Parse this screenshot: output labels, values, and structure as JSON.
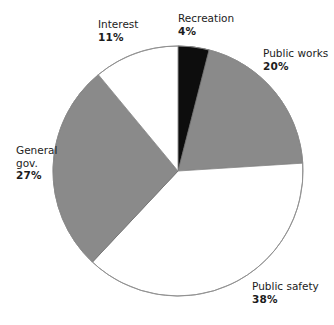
{
  "chart_data": {
    "type": "pie",
    "title": "",
    "categories": [
      "Recreation",
      "Public works",
      "Public safety",
      "General gov.",
      "Interest"
    ],
    "values": [
      4,
      20,
      38,
      27,
      11
    ],
    "unit": "%",
    "legend": "none",
    "start_angle_deg": 0,
    "direction": "clockwise",
    "slices": [
      {
        "label": "Recreation",
        "value": 4,
        "value_text": "4%",
        "color": "#0d0d0d",
        "fill_name": "black",
        "start_pct": 0,
        "end_pct": 4
      },
      {
        "label": "Public works",
        "value": 20,
        "value_text": "20%",
        "color": "#8a8a8a",
        "fill_name": "gray",
        "start_pct": 4,
        "end_pct": 24
      },
      {
        "label": "Public safety",
        "value": 38,
        "value_text": "38%",
        "color": "#ffffff",
        "fill_name": "white",
        "start_pct": 24,
        "end_pct": 62
      },
      {
        "label": "General gov.",
        "value": 27,
        "value_text": "27%",
        "color": "#8a8a8a",
        "fill_name": "gray",
        "start_pct": 62,
        "end_pct": 89
      },
      {
        "label": "Interest",
        "value": 11,
        "value_text": "11%",
        "color": "#ffffff",
        "fill_name": "white",
        "start_pct": 89,
        "end_pct": 100
      }
    ]
  },
  "labels": {
    "recreation": {
      "name": "Recreation",
      "pct": "4%"
    },
    "public_works": {
      "name": "Public works",
      "pct": "20%"
    },
    "public_safety": {
      "name": "Public safety",
      "pct": "38%"
    },
    "general_gov": {
      "name": "General",
      "name2": "gov.",
      "pct": "27%"
    },
    "interest": {
      "name": "Interest",
      "pct": "11%"
    }
  },
  "geometry": {
    "center_x": 178,
    "center_y": 171,
    "radius": 125
  },
  "colors": {
    "background": "#ffffff",
    "gray_fill": "#8a8a8a",
    "black_fill": "#0d0d0d",
    "white_fill": "#ffffff",
    "outline": "#8f8f8f",
    "text": "#1c1c1c"
  }
}
